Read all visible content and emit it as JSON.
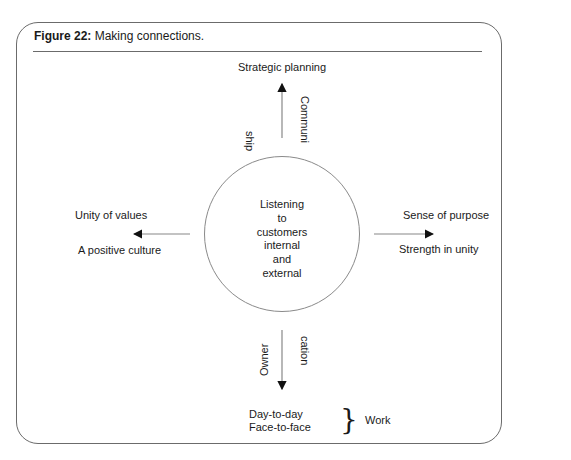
{
  "figure": {
    "label": "Figure 22:",
    "caption": "Making connections."
  },
  "center": {
    "lines": [
      "Listening",
      "to",
      "customers",
      "internal",
      "and",
      "external"
    ]
  },
  "top": {
    "label": "Strategic planning",
    "side_left": "ship",
    "side_right": "Communi"
  },
  "left": {
    "above": "Unity of values",
    "below": "A positive culture"
  },
  "right": {
    "above": "Sense of purpose",
    "below": "Strength in unity"
  },
  "bottom": {
    "side_left": "Owner",
    "side_right": "cation",
    "line1": "Day-to-day",
    "line2": "Face-to-face",
    "brace": "}",
    "group_label": "Work"
  },
  "colors": {
    "frame": "#6b6b6b",
    "arrow": "#888888",
    "text": "#1a1a1a"
  }
}
